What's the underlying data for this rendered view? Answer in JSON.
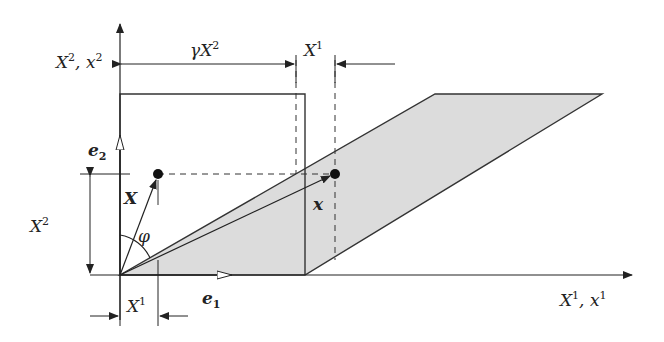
{
  "diagram": {
    "type": "simple-shear-deformation",
    "colors": {
      "line": "#333333",
      "fill": "#dcdcdc",
      "background": "#ffffff"
    },
    "labels": {
      "y_axis": {
        "base": "X",
        "sup": "2",
        "sep": ", ",
        "base2": "x",
        "sup2": "2"
      },
      "x_axis": {
        "base": "X",
        "sup": "1",
        "sep": ", ",
        "base2": "x",
        "sup2": "1"
      },
      "shear_offset": {
        "prefix": "γ",
        "base": "X",
        "sup": "2"
      },
      "top_x1": {
        "base": "X",
        "sup": "1"
      },
      "bottom_x1": {
        "base": "X",
        "sup": "1"
      },
      "left_x2": {
        "base": "X",
        "sup": "2"
      },
      "e1": {
        "base": "e",
        "sub": "1"
      },
      "e2": {
        "base": "e",
        "sub": "2"
      },
      "ref_vector": "X",
      "cur_vector": "x",
      "angle": "φ"
    },
    "geometry": {
      "origin": [
        120,
        275
      ],
      "reference_square": [
        [
          120,
          94
        ],
        [
          305,
          94
        ],
        [
          305,
          275
        ],
        [
          120,
          275
        ]
      ],
      "deformed_parallelogram": [
        [
          120,
          275
        ],
        [
          305,
          275
        ],
        [
          602,
          94
        ],
        [
          435,
          94
        ]
      ],
      "reference_point": [
        158,
        174
      ],
      "current_point": [
        335,
        174
      ]
    }
  }
}
